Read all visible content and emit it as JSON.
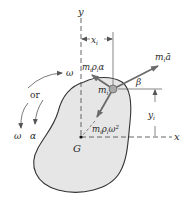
{
  "figure": {
    "type": "rigid-body-kinetics-diagram",
    "colors": {
      "body_fill": "#e6e6e6",
      "body_outline": "#333333",
      "arrow": "#6b6b6b",
      "particle": "#a9a9a9",
      "text": "#2a2a2a"
    }
  },
  "axes": {
    "y_label": "y",
    "x_label": "x",
    "origin_label": "G"
  },
  "dimensions": {
    "x_i": {
      "base": "x",
      "sub": "i"
    },
    "y_i": {
      "base": "y",
      "sub": "i"
    }
  },
  "particle": {
    "base": "m",
    "sub": "i"
  },
  "vectors": {
    "resultant": {
      "label_base": "m",
      "label_sub": "i",
      "label_suffix": "ā"
    },
    "tangential": {
      "label_m": "m",
      "label_sub1": "i",
      "label_rho": "ρ",
      "label_sub2": "i",
      "label_suffix": "α"
    },
    "normal": {
      "label_m": "m",
      "label_sub1": "i",
      "label_rho": "ρ",
      "label_sub2": "i",
      "label_suffix": "ω",
      "label_sup": "2"
    }
  },
  "angle": {
    "label": "β"
  },
  "rotation": {
    "ccw_omega": "ω",
    "or_label": "or",
    "cw_omega": "ω",
    "cw_alpha": "α"
  }
}
